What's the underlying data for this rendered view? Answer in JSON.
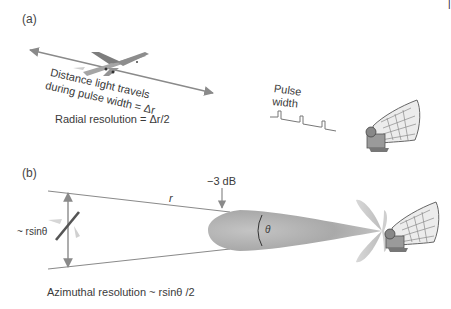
{
  "figure": {
    "corner_mark": "|",
    "panel_a": {
      "label": "(a)",
      "arrow_text_line1": "Distance light travels",
      "arrow_text_line2": "during pulse width = Δr",
      "radial_resolution": "Radial resolution = Δr/2",
      "pulse_label_line1": "Pulse",
      "pulse_label_line2": "width",
      "icons": [
        "airplane-icon",
        "radar-dish-icon",
        "pulse-train-icon",
        "double-arrow-icon"
      ]
    },
    "panel_b": {
      "label": "(b)",
      "range_label": "r",
      "beam_edge_label": "−3 dB",
      "beam_angle_label": "θ",
      "cross_range_label": "~ rsinθ",
      "azimuthal_resolution": "Azimuthal resolution ~ rsinθ /2",
      "icons": [
        "aircraft-silhouette-icon",
        "main-lobe-icon",
        "side-lobes-icon",
        "radar-dish-icon",
        "vertical-double-arrow-icon"
      ]
    },
    "colors": {
      "line": "#8a8a8a",
      "beam_dark": "#9a9a9a",
      "beam_light": "#d6d6d6",
      "text": "#3a3a3a"
    }
  }
}
